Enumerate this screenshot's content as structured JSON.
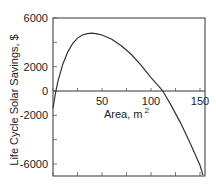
{
  "chart_data": {
    "type": "line",
    "title": "",
    "xlabel": "Area, m",
    "xlabel_superscript": "2",
    "ylabel": "Life Cycle Solar Savings, $",
    "xlim": [
      0,
      155
    ],
    "ylim": [
      -7000,
      6000
    ],
    "x_ticks": [
      0,
      25,
      50,
      75,
      100,
      125,
      150
    ],
    "x_tick_labels": [
      "50",
      "100",
      "150"
    ],
    "x_tick_label_values": [
      50,
      100,
      150
    ],
    "y_ticks": [
      6000,
      4000,
      2000,
      0,
      -2000,
      -4000,
      -6000
    ],
    "y_tick_labels": [
      "6000",
      "2000",
      "0",
      "-2000",
      "-6000"
    ],
    "y_tick_label_values": [
      6000,
      2000,
      0,
      -2000,
      -6000
    ],
    "grid": false,
    "zero_line": true,
    "legend": null,
    "series": [
      {
        "name": "Life Cycle Solar Savings",
        "x": [
          0,
          3,
          5,
          10,
          15,
          20,
          25,
          30,
          35,
          40,
          45,
          50,
          60,
          70,
          80,
          90,
          100,
          110,
          112,
          120,
          130,
          140,
          150,
          153
        ],
        "y": [
          -1400,
          0,
          800,
          2200,
          3200,
          3900,
          4350,
          4600,
          4720,
          4750,
          4700,
          4600,
          4250,
          3700,
          3000,
          2100,
          1100,
          200,
          0,
          -1100,
          -2600,
          -4300,
          -6100,
          -6900
        ]
      }
    ]
  }
}
